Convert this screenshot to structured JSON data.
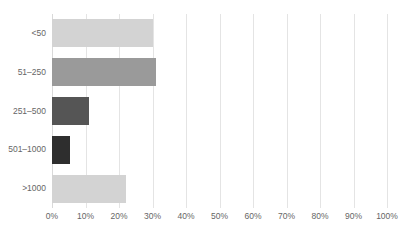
{
  "chart_data": {
    "type": "bar",
    "orientation": "horizontal",
    "title": "",
    "xlabel": "",
    "ylabel": "",
    "categories": [
      "<50",
      "51–250",
      "251–500",
      "501–1000",
      ">1000"
    ],
    "values": [
      30,
      31,
      11,
      5.5,
      22
    ],
    "value_unit": "%",
    "xlim": [
      0,
      100
    ],
    "xticks": [
      0,
      10,
      20,
      30,
      40,
      50,
      60,
      70,
      80,
      90,
      100
    ],
    "xtick_labels": [
      "0%",
      "10%",
      "20%",
      "30%",
      "40%",
      "50%",
      "60%",
      "70%",
      "80%",
      "90%",
      "100%"
    ],
    "grid": true,
    "grid_axis": "x",
    "legend": false,
    "bar_colors": [
      "#d3d3d3",
      "#9a9a9a",
      "#555555",
      "#2e2e2e",
      "#d3d3d3"
    ],
    "series": [
      {
        "name": "",
        "points": [
          {
            "category": "<50",
            "value": 30,
            "label": "30%",
            "color": "#d3d3d3"
          },
          {
            "category": "51–250",
            "value": 31,
            "label": "31%",
            "color": "#9a9a9a"
          },
          {
            "category": "251–500",
            "value": 11,
            "label": "11%",
            "color": "#555555"
          },
          {
            "category": "501–1000",
            "value": 5.5,
            "label": "5.5%",
            "color": "#2e2e2e"
          },
          {
            "category": ">1000",
            "value": 22,
            "label": "22%",
            "color": "#d3d3d3"
          }
        ]
      }
    ]
  },
  "colors": {
    "gridline": "#e4e4e4",
    "axis": "#d9d9d9",
    "tick_text": "#666666",
    "background": "#ffffff"
  }
}
